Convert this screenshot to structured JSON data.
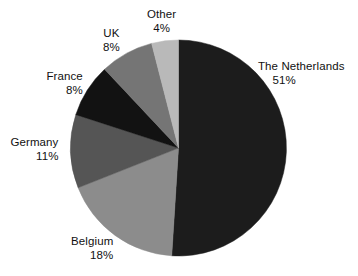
{
  "chart_data": {
    "type": "pie",
    "title": "",
    "subtitle": "",
    "xlabel": "",
    "ylabel": "",
    "legend_position": "none",
    "grid": false,
    "start_angle_deg": 0,
    "direction": "clockwise",
    "value_unit": "percent",
    "categories": [
      "The Netherlands",
      "Belgium",
      "Germany",
      "France",
      "UK",
      "Other"
    ],
    "values": [
      51,
      18,
      11,
      8,
      8,
      4
    ],
    "slices": [
      {
        "label": "The Netherlands",
        "value": 51,
        "value_text": "51%",
        "color": "#1c1c1c"
      },
      {
        "label": "Belgium",
        "value": 18,
        "value_text": "18%",
        "color": "#8c8c8c"
      },
      {
        "label": "Germany",
        "value": 11,
        "value_text": "11%",
        "color": "#555555"
      },
      {
        "label": "France",
        "value": 8,
        "value_text": "8%",
        "color": "#121212"
      },
      {
        "label": "UK",
        "value": 8,
        "value_text": "8%",
        "color": "#757575"
      },
      {
        "label": "Other",
        "value": 4,
        "value_text": "4%",
        "color": "#b9b9b9"
      }
    ]
  },
  "labels": {
    "netherlands": {
      "name": "The Netherlands",
      "value": "51%"
    },
    "belgium": {
      "name": "Belgium",
      "value": "18%"
    },
    "germany": {
      "name": "Germany",
      "value": "11%"
    },
    "france": {
      "name": "France",
      "value": "8%"
    },
    "uk": {
      "name": "UK",
      "value": "8%"
    },
    "other": {
      "name": "Other",
      "value": "4%"
    }
  },
  "geometry": {
    "center_x": 178.5,
    "center_y": 148,
    "radius": 108
  },
  "colors": {
    "background": "#ffffff",
    "text": "#111111"
  }
}
